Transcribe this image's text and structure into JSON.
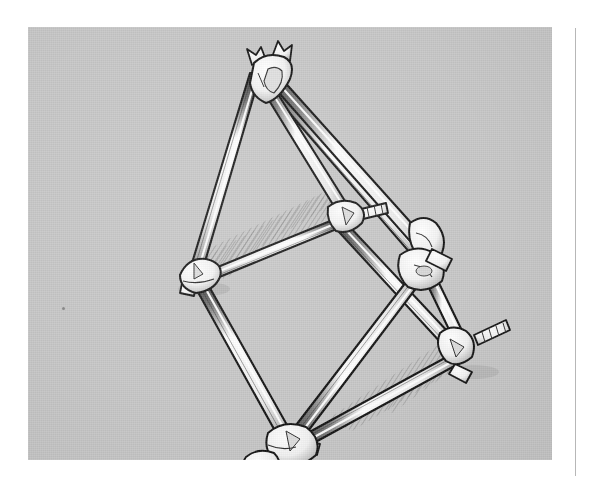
{
  "page": {
    "background_color": "#ffffff",
    "width": 591,
    "height": 486,
    "gutter_rule_color": "#b7b7b7"
  },
  "figure": {
    "title": "",
    "caption": "",
    "kind": "technical-line-illustration",
    "style": "black ink line art with white fills and diagonal hatch shading",
    "panel": {
      "background_color": "#c6c6c6",
      "left": 28,
      "top": 27,
      "width": 524,
      "height": 433
    },
    "ink_color": "#141414",
    "fill_color": "#f7f7f7",
    "shade_color": "#9a9a9a",
    "shadow_hatch_color": "#8e8e8e",
    "nodes": [
      {
        "id": "apex",
        "label": "top joint cluster",
        "x": 243,
        "y": 46
      },
      {
        "id": "left",
        "label": "left joint",
        "x": 168,
        "y": 245
      },
      {
        "id": "mid",
        "label": "middle joint with stub",
        "x": 318,
        "y": 190
      },
      {
        "id": "right",
        "label": "right joint cluster",
        "x": 401,
        "y": 238
      },
      {
        "id": "lower-right",
        "label": "lower right joint with threaded stub",
        "x": 437,
        "y": 330
      },
      {
        "id": "bottom",
        "label": "bottom joint cluster",
        "x": 265,
        "y": 424
      }
    ],
    "struts": [
      {
        "from": "apex",
        "to": "left"
      },
      {
        "from": "apex",
        "to": "mid"
      },
      {
        "from": "apex",
        "to": "right"
      },
      {
        "from": "left",
        "to": "mid"
      },
      {
        "from": "left",
        "to": "bottom"
      },
      {
        "from": "mid",
        "to": "lower-right"
      },
      {
        "from": "right",
        "to": "bottom"
      },
      {
        "from": "right",
        "to": "lower-right"
      },
      {
        "from": "lower-right",
        "to": "bottom"
      }
    ],
    "protrusions": [
      {
        "at": "mid",
        "label": "short ribbed stub, upper right"
      },
      {
        "at": "lower-right",
        "label": "long ribbed / threaded stub, right"
      },
      {
        "at": "left",
        "label": "small square cap, lower left"
      },
      {
        "at": "bottom",
        "label": "small square cap, right"
      },
      {
        "at": "apex",
        "label": "paired forked prongs, top"
      }
    ],
    "cast_shadow": {
      "description": "diagonal hatch shadow cast on the ground plane under the upper-left panel and lower-right bay",
      "hatch_angle_deg": 30
    },
    "speck": {
      "x": 62,
      "y": 307,
      "label": "ink speck on plate"
    }
  }
}
